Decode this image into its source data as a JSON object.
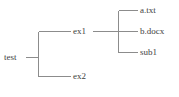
{
  "diagram": {
    "type": "directory-tree",
    "line_color": "#8c8c8c",
    "text_color": "#3e3e3e",
    "background_color": "#ffffff",
    "root": {
      "id": "test",
      "label": "test",
      "children": [
        {
          "id": "ex1",
          "label": "ex1",
          "children": [
            {
              "id": "a-txt",
              "label": "a.txt",
              "children": []
            },
            {
              "id": "b-docx",
              "label": "b.docx",
              "children": []
            },
            {
              "id": "sub1",
              "label": "sub1",
              "children": []
            }
          ]
        },
        {
          "id": "ex2",
          "label": "ex2",
          "children": []
        }
      ]
    },
    "labels": {
      "test": "test",
      "ex1": "ex1",
      "ex2": "ex2",
      "a_txt": "a.txt",
      "b_docx": "b.docx",
      "sub1": "sub1"
    },
    "caption": ""
  }
}
